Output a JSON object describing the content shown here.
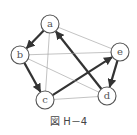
{
  "caption": "図 H－4",
  "colors": {
    "bold_edge": "#333333",
    "thin_edge": "#9a9a9a",
    "node_stroke": "#555555"
  },
  "nodes": [
    {
      "id": "a",
      "label": "a"
    },
    {
      "id": "b",
      "label": "b"
    },
    {
      "id": "c",
      "label": "c"
    },
    {
      "id": "d",
      "label": "d"
    },
    {
      "id": "e",
      "label": "e"
    }
  ],
  "edges": [
    {
      "from": "a",
      "to": "b",
      "style": "bold",
      "directed": true
    },
    {
      "from": "b",
      "to": "c",
      "style": "bold",
      "directed": true
    },
    {
      "from": "c",
      "to": "e",
      "style": "bold",
      "directed": true
    },
    {
      "from": "e",
      "to": "d",
      "style": "bold",
      "directed": true
    },
    {
      "from": "d",
      "to": "a",
      "style": "bold",
      "directed": true
    },
    {
      "from": "a",
      "to": "e",
      "style": "thin",
      "directed": false
    },
    {
      "from": "a",
      "to": "c",
      "style": "thin",
      "directed": false
    },
    {
      "from": "b",
      "to": "e",
      "style": "thin",
      "directed": false
    },
    {
      "from": "b",
      "to": "d",
      "style": "thin",
      "directed": false
    },
    {
      "from": "c",
      "to": "d",
      "style": "thin",
      "directed": false
    }
  ]
}
